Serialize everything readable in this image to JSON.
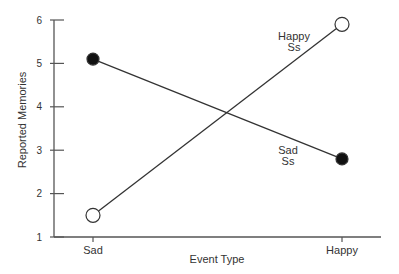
{
  "chart_data": {
    "type": "line",
    "title": "",
    "xlabel": "Event Type",
    "ylabel": "Reported Memories",
    "categories": [
      "Sad",
      "Happy"
    ],
    "ylim": [
      1,
      6
    ],
    "yticks": [
      1,
      2,
      3,
      4,
      5,
      6
    ],
    "grid": false,
    "legend_position": "inline annotations",
    "series": [
      {
        "name": "Sad Ss",
        "label_line1": "Sad",
        "label_line2": "Ss",
        "marker": "filled-circle",
        "values": [
          5.1,
          2.8
        ]
      },
      {
        "name": "Happy Ss",
        "label_line1": "Happy",
        "label_line2": "Ss",
        "marker": "open-circle",
        "values": [
          1.5,
          5.9
        ]
      }
    ]
  },
  "colors": {
    "line": "#333333",
    "axis": "#555555",
    "text": "#333333",
    "filled_marker": "#111111",
    "open_marker_fill": "#ffffff"
  }
}
